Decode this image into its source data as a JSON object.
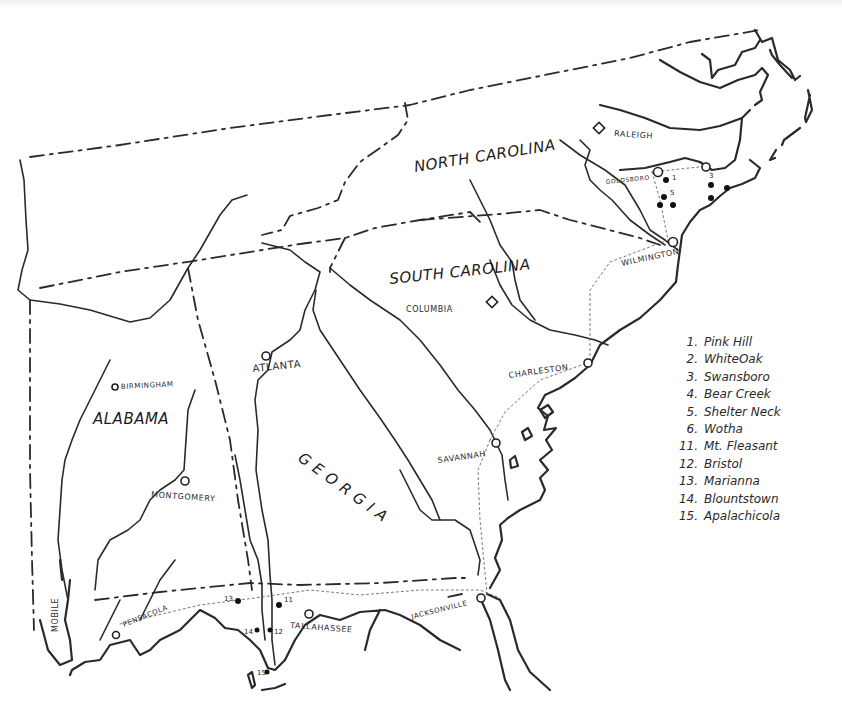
{
  "map": {
    "states": [
      {
        "name": "NORTH CAROLINA",
        "x": 415,
        "y": 168,
        "rotate": -9
      },
      {
        "name": "SOUTH CAROLINA",
        "x": 390,
        "y": 280,
        "rotate": -6
      },
      {
        "name": "ALABAMA",
        "x": 93,
        "y": 424,
        "rotate": 0
      },
      {
        "name": "GEORGIA",
        "x": 297,
        "y": 463,
        "rotate": 36
      }
    ],
    "cities": {
      "raleigh": "RALEIGH",
      "goldsboro": "GOLDSBORO",
      "wilmington": "WILMINGTON",
      "columbia": "COLUMBIA",
      "charleston": "CHARLESTON",
      "savannah": "SAVANNAH",
      "atlanta": "ATLANTA",
      "birmingham": "BIRMINGHAM",
      "montgomery": "MONTGOMERY",
      "mobile": "MOBILE",
      "pensacola": "PENSACOLA",
      "tallahassee": "TALLAHASSEE",
      "jacksonville": "JACKSONVILLE"
    },
    "site_markers": {
      "s1": "1",
      "s2": "2",
      "s3": "3",
      "s4": "4",
      "s5": "5",
      "s6": "6",
      "s11": "11",
      "s12": "12",
      "s13": "13",
      "s14": "14",
      "s15": "15"
    }
  },
  "legend": [
    {
      "num": "1.",
      "label": "Pink Hill"
    },
    {
      "num": "2.",
      "label": "WhiteOak"
    },
    {
      "num": "3.",
      "label": "Swansboro"
    },
    {
      "num": "4.",
      "label": "Bear Creek"
    },
    {
      "num": "5.",
      "label": "Shelter Neck"
    },
    {
      "num": "6.",
      "label": "Wotha"
    },
    {
      "num": "11.",
      "label": "Mt. Fleasant"
    },
    {
      "num": "12.",
      "label": "Bristol"
    },
    {
      "num": "13.",
      "label": "Marianna"
    },
    {
      "num": "14.",
      "label": "Blountstown"
    },
    {
      "num": "15.",
      "label": "Apalachicola"
    }
  ]
}
